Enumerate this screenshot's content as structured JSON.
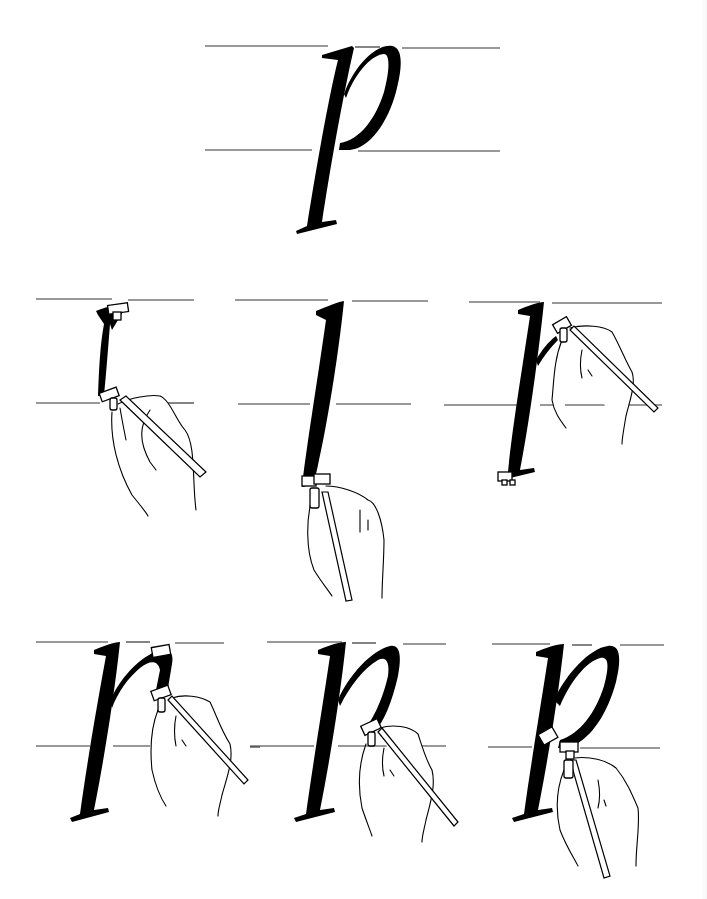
{
  "figure": {
    "title": "Italic lowercase p — stroke sequence",
    "letter": "p",
    "ink_color": "#000000",
    "guide_color": "#333333",
    "background": "#ffffff"
  },
  "model_letter": {
    "label": "p",
    "description": "Finished italic p between ascender and x-height guide lines"
  },
  "steps": [
    {
      "index": 1,
      "label": "Step 1",
      "description": "Pen entry stroke begins at top guide, short downstroke to baseline"
    },
    {
      "index": 2,
      "label": "Step 2",
      "description": "Full descending stem pulled below baseline"
    },
    {
      "index": 3,
      "label": "Step 3",
      "description": "Foot serif added; pen returns to top of stem to start branch"
    },
    {
      "index": 4,
      "label": "Step 4",
      "description": "Branching arch stroke pushed up and over to the right"
    },
    {
      "index": 5,
      "label": "Step 5",
      "description": "Right side of bowl pulled down toward baseline"
    },
    {
      "index": 6,
      "label": "Step 6",
      "description": "Bowl closed back into the stem at the baseline"
    }
  ]
}
